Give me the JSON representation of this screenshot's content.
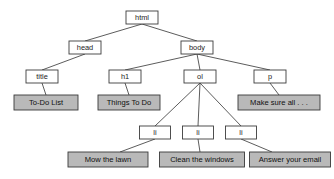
{
  "diagram": {
    "type": "tree",
    "colors": {
      "element_box_fill": "#ffffff",
      "text_box_fill": "#b9b9b9",
      "stroke": "#3c3c3c",
      "edge": "#4a4a4a",
      "background": "#ffffff"
    },
    "element_nodes": [
      {
        "id": "html",
        "label": "html",
        "x": 142,
        "y": 17.5,
        "w": 32,
        "h": 13
      },
      {
        "id": "head",
        "label": "head",
        "x": 85,
        "y": 47.5,
        "w": 32,
        "h": 13
      },
      {
        "id": "body",
        "label": "body",
        "x": 197,
        "y": 47.5,
        "w": 32,
        "h": 13
      },
      {
        "id": "title",
        "label": "title",
        "x": 42,
        "y": 76.5,
        "w": 32,
        "h": 13
      },
      {
        "id": "h1",
        "label": "h1",
        "x": 125,
        "y": 76.5,
        "w": 32,
        "h": 13
      },
      {
        "id": "ol",
        "label": "ol",
        "x": 200,
        "y": 76.5,
        "w": 32,
        "h": 13
      },
      {
        "id": "p",
        "label": "p",
        "x": 270,
        "y": 76.5,
        "w": 32,
        "h": 13
      },
      {
        "id": "li1",
        "label": "li",
        "x": 155,
        "y": 132.5,
        "w": 31,
        "h": 13
      },
      {
        "id": "li2",
        "label": "li",
        "x": 198,
        "y": 132.5,
        "w": 31,
        "h": 13
      },
      {
        "id": "li3",
        "label": "li",
        "x": 241,
        "y": 132.5,
        "w": 31,
        "h": 13
      }
    ],
    "text_nodes": [
      {
        "id": "t_title",
        "label": "To-Do List",
        "x": 46,
        "y": 102.5,
        "w": 64,
        "h": 15
      },
      {
        "id": "t_h1",
        "label": "Things To Do",
        "x": 129,
        "y": 102.5,
        "w": 62,
        "h": 15
      },
      {
        "id": "t_p",
        "label": "Make sure all . . .",
        "x": 279,
        "y": 102.5,
        "w": 82,
        "h": 15
      },
      {
        "id": "t_li1",
        "label": "Mow the lawn",
        "x": 108,
        "y": 159.5,
        "w": 80,
        "h": 15
      },
      {
        "id": "t_li2",
        "label": "Clean the windows",
        "x": 202,
        "y": 159.5,
        "w": 85,
        "h": 15
      },
      {
        "id": "t_li3",
        "label": "Answer your email",
        "x": 290,
        "y": 159.5,
        "w": 81,
        "h": 15
      }
    ],
    "edges": [
      {
        "from": "html",
        "to": "head",
        "x1": 142,
        "y1": 24,
        "x2": 85,
        "y2": 41
      },
      {
        "from": "html",
        "to": "body",
        "x1": 142,
        "y1": 24,
        "x2": 197,
        "y2": 41
      },
      {
        "from": "head",
        "to": "title",
        "x1": 85,
        "y1": 54,
        "x2": 42,
        "y2": 70
      },
      {
        "from": "body",
        "to": "h1",
        "x1": 197,
        "y1": 54,
        "x2": 125,
        "y2": 70
      },
      {
        "from": "body",
        "to": "ol",
        "x1": 197,
        "y1": 54,
        "x2": 200,
        "y2": 70
      },
      {
        "from": "body",
        "to": "p",
        "x1": 197,
        "y1": 54,
        "x2": 270,
        "y2": 70
      },
      {
        "from": "title",
        "to": "t_title",
        "x1": 42,
        "y1": 83,
        "x2": 46,
        "y2": 95
      },
      {
        "from": "h1",
        "to": "t_h1",
        "x1": 125,
        "y1": 83,
        "x2": 129,
        "y2": 95
      },
      {
        "from": "p",
        "to": "t_p",
        "x1": 270,
        "y1": 83,
        "x2": 279,
        "y2": 95
      },
      {
        "from": "ol",
        "to": "li1",
        "x1": 200,
        "y1": 83,
        "x2": 155,
        "y2": 126
      },
      {
        "from": "ol",
        "to": "li2",
        "x1": 200,
        "y1": 83,
        "x2": 198,
        "y2": 126
      },
      {
        "from": "ol",
        "to": "li3",
        "x1": 200,
        "y1": 83,
        "x2": 241,
        "y2": 126
      },
      {
        "from": "li1",
        "to": "t_li1",
        "x1": 155,
        "y1": 139,
        "x2": 120,
        "y2": 152
      },
      {
        "from": "li2",
        "to": "t_li2",
        "x1": 198,
        "y1": 139,
        "x2": 200,
        "y2": 152
      },
      {
        "from": "li3",
        "to": "t_li3",
        "x1": 241,
        "y1": 139,
        "x2": 272,
        "y2": 152
      }
    ]
  }
}
